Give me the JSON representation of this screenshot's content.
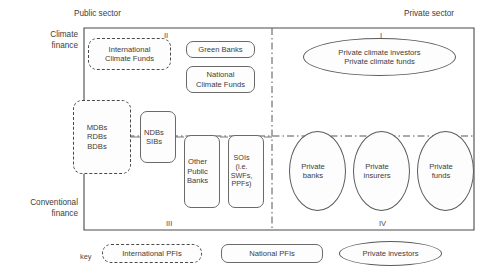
{
  "figure": {
    "sector_labels": {
      "public": "Public sector",
      "private": "Private sector"
    },
    "axis_labels": {
      "top": "Climate\nfinance",
      "top_line1": "Climate",
      "top_line2": "finance",
      "bottom_line1": "Conventional",
      "bottom_line2": "finance"
    },
    "quadrants": {
      "q1": "I",
      "q2": "II",
      "q3": "III",
      "q4": "IV"
    },
    "nodes": [
      {
        "id": "international-climate-funds",
        "label": "International\nClimate Funds",
        "line1": "International",
        "line2": "Climate Funds",
        "shape": "rounded-dashed",
        "quadrant": "II"
      },
      {
        "id": "green-banks",
        "label": "Green Banks",
        "line1": "Green Banks",
        "line2": "",
        "shape": "rounded",
        "quadrant": "II"
      },
      {
        "id": "national-climate-funds",
        "label": "National\nClimate Funds",
        "line1": "National",
        "line2": "Climate Funds",
        "shape": "rounded",
        "quadrant": "II"
      },
      {
        "id": "private-climate",
        "label": "Private climate investors\nPrivate climate funds",
        "line1": "Private climate investors",
        "line2": "Private climate funds",
        "shape": "ellipse",
        "quadrant": "I"
      },
      {
        "id": "mdbs-rdbs-bdbs",
        "label": "MDBs\nRDBs\nBDBs",
        "line1": "MDBs",
        "line2": "RDBs",
        "line3": "BDBs",
        "shape": "rounded-dashed",
        "quadrant": "II-III"
      },
      {
        "id": "ndbs-sibs",
        "label": "NDBs\nSIBs",
        "line1": "NDBs",
        "line2": "SIBs",
        "shape": "rounded",
        "quadrant": "II-III"
      },
      {
        "id": "other-public-banks",
        "label": "Other\nPublic\nBanks",
        "line1": "Other",
        "line2": "Public",
        "line3": "Banks",
        "shape": "rounded",
        "quadrant": "III"
      },
      {
        "id": "sois",
        "label": "SOIs\n(i.e.\nSWFs,\nPPFs)",
        "line1": "SOIs",
        "line2": "(i.e.",
        "line3": "SWFs,",
        "line4": "PPFs)",
        "shape": "rounded",
        "quadrant": "III"
      },
      {
        "id": "private-banks",
        "label": "Private\nbanks",
        "line1": "Private",
        "line2": "banks",
        "shape": "ellipse",
        "quadrant": "IV"
      },
      {
        "id": "private-insurers",
        "label": "Private\ninsurers",
        "line1": "Private",
        "line2": "insurers",
        "shape": "ellipse",
        "quadrant": "IV"
      },
      {
        "id": "private-funds",
        "label": "Private\nfunds",
        "line1": "Private",
        "line2": "funds",
        "shape": "ellipse",
        "quadrant": "IV"
      }
    ],
    "key": {
      "title": "key",
      "items": [
        {
          "id": "international-pfis",
          "label": "International PFIs",
          "shape": "rounded-dashed"
        },
        {
          "id": "national-pfis",
          "label": "National PFIs",
          "shape": "rounded"
        },
        {
          "id": "private-investors",
          "label": "Private investors",
          "shape": "ellipse"
        }
      ]
    },
    "colors": {
      "line": "#4a4a4a",
      "text": "#3c3c3c",
      "background": "#ffffff",
      "node_fill": "#fdfdfd"
    }
  }
}
